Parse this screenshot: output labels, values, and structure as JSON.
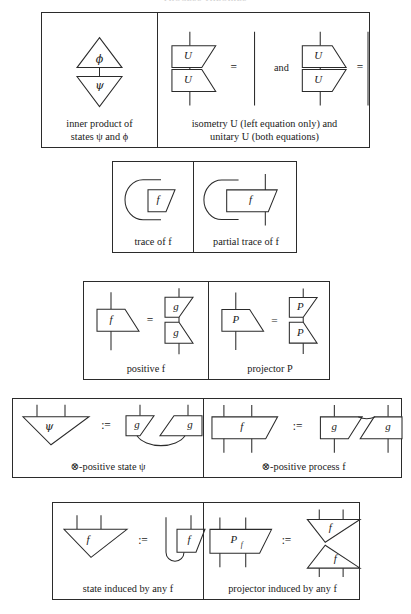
{
  "page": {
    "cutoff_title": "PROCESS THEORIES",
    "background": "#ffffff",
    "ink": "#2b2b2b"
  },
  "panels": [
    {
      "id": "inner-product-isometry",
      "cells": [
        {
          "id": "inner-product",
          "caption": "inner product of\nstates ψ and ϕ",
          "labels": [
            "ϕ",
            "ψ"
          ]
        },
        {
          "id": "isometry-unitary",
          "caption": "isometry U (left equation only) and\nunitary U (both equations)",
          "labels": [
            "U",
            "U",
            "=",
            "and",
            "U",
            "U",
            "="
          ]
        }
      ]
    },
    {
      "id": "traces",
      "cells": [
        {
          "id": "trace",
          "caption": "trace of f",
          "labels": [
            "f"
          ]
        },
        {
          "id": "partial-trace",
          "caption": "partial trace of f",
          "labels": [
            "f"
          ]
        }
      ]
    },
    {
      "id": "positive-projector",
      "cells": [
        {
          "id": "positive",
          "caption": "positive f",
          "labels": [
            "f",
            "=",
            "g",
            "g"
          ]
        },
        {
          "id": "projector",
          "caption": "projector P",
          "labels": [
            "P",
            "=",
            "P",
            "P"
          ]
        }
      ]
    },
    {
      "id": "tensor-positive",
      "cells": [
        {
          "id": "tensor-positive-state",
          "caption": "⊗-positive state ψ",
          "labels": [
            "ψ",
            ":=",
            "g",
            "g"
          ]
        },
        {
          "id": "tensor-positive-process",
          "caption": "⊗-positive process f",
          "labels": [
            "f",
            ":=",
            "g",
            "g"
          ]
        }
      ]
    },
    {
      "id": "induced",
      "cells": [
        {
          "id": "state-induced",
          "caption": "state induced by any f",
          "labels": [
            "f",
            ":=",
            "f"
          ]
        },
        {
          "id": "projector-induced",
          "caption": "projector induced by any f",
          "labels": [
            "P",
            "f",
            ":=",
            "f",
            "f"
          ]
        }
      ]
    }
  ],
  "glyphs": {
    "phi": "ϕ",
    "psi": "ψ",
    "U": "U",
    "f": "f",
    "g": "g",
    "P": "P",
    "equals": "=",
    "defines": ":=",
    "and": "and",
    "tensor": "⊗",
    "P_sub_f": "f"
  },
  "captions": {
    "inner_product": "inner product of\nstates ψ and ϕ",
    "isometry": "isometry U (left equation only) and\nunitary U (both equations)",
    "trace": "trace of f",
    "partial_trace": "partial trace of f",
    "positive": "positive f",
    "projector": "projector P",
    "tensor_positive_state": "⊗-positive state ψ",
    "tensor_positive_process": "⊗-positive process f",
    "state_induced": "state induced by any f",
    "projector_induced": "projector induced by any f"
  }
}
